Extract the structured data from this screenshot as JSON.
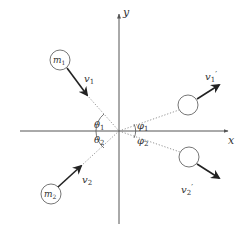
{
  "diagram": {
    "type": "two-dimensional elastic collision",
    "colors": {
      "axis": "#555555",
      "arrow": "#222222",
      "dotted": "#777777",
      "circle": "#666666",
      "text": "#333333"
    },
    "axes": {
      "x_label": "x",
      "y_label": "y",
      "origin": [
        119,
        131
      ]
    },
    "bodies": [
      {
        "id": "m1",
        "label": "m",
        "subscript": "1",
        "center": [
          60,
          60
        ],
        "radius": 10,
        "velocity": {
          "label": "v",
          "subscript": "1",
          "prime": "",
          "from": [
            67,
            68
          ],
          "to": [
            87,
            95
          ],
          "label_pos": [
            84,
            82
          ]
        }
      },
      {
        "id": "m2",
        "label": "m",
        "subscript": "2",
        "center": [
          51,
          194
        ],
        "radius": 10,
        "velocity": {
          "label": "v",
          "subscript": "2",
          "prime": "",
          "from": [
            58,
            187
          ],
          "to": [
            81,
            166
          ],
          "label_pos": [
            82,
            183
          ]
        }
      },
      {
        "id": "m1-after",
        "label": "",
        "subscript": "",
        "center": [
          188,
          105
        ],
        "radius": 10,
        "velocity": {
          "label": "v",
          "subscript": "1",
          "prime": "′",
          "from": [
            197,
            99
          ],
          "to": [
            219,
            85
          ],
          "label_pos": [
            205,
            80
          ]
        }
      },
      {
        "id": "m2-after",
        "label": "",
        "subscript": "",
        "center": [
          189,
          157
        ],
        "radius": 10,
        "velocity": {
          "label": "v",
          "subscript": "2",
          "prime": "′",
          "from": [
            197,
            164
          ],
          "to": [
            219,
            178
          ],
          "label_pos": [
            181,
            193
          ]
        }
      }
    ],
    "angles": [
      {
        "symbol": "θ",
        "subscript": "1",
        "pos": [
          94,
          128
        ]
      },
      {
        "symbol": "θ",
        "subscript": "2",
        "pos": [
          94,
          143
        ]
      },
      {
        "symbol": "φ",
        "subscript": "1",
        "pos": [
          138,
          130
        ]
      },
      {
        "symbol": "φ",
        "subscript": "2",
        "pos": [
          138,
          144
        ]
      }
    ]
  }
}
